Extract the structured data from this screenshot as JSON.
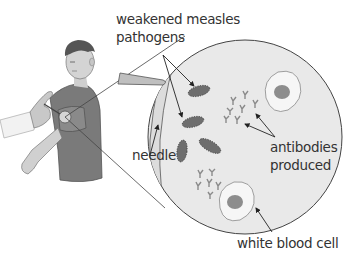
{
  "diagram": {
    "labels": {
      "pathogens_line1": "weakened measles",
      "pathogens_line2": "pathogens",
      "needle": "needle",
      "antibodies_line1": "antibodies",
      "antibodies_line2": "produced",
      "white_blood_cell": "white blood cell"
    },
    "colors": {
      "circle_fill": "#e9e9e9",
      "outline": "#444444",
      "pathogen": "#6e6e6e",
      "antibody": "#8a8a8a",
      "cell_fill": "#f6f6f6",
      "nucleus": "#8d8d8d",
      "shirt": "#7a7a7a",
      "skin": "#cfcfcf",
      "text": "#333333"
    }
  }
}
